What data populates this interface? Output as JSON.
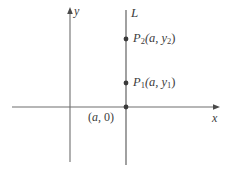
{
  "figure": {
    "type": "coordinate-plane-diagram",
    "background_color": "#ffffff",
    "stroke_color": "#6e6e6e",
    "text_color": "#3c3c3c"
  },
  "axes": {
    "x_axis": {
      "label": "x",
      "y_pixel": 107,
      "x_start": 12,
      "x_end": 220,
      "arrow": "right"
    },
    "y_axis": {
      "label": "y",
      "x_pixel": 70,
      "y_start": 8,
      "y_end": 162,
      "arrow": "up"
    }
  },
  "line": {
    "name": "L",
    "label": "L",
    "equation_form": "x = a",
    "x_pixel": 126,
    "y_start": 10,
    "y_end": 165,
    "orientation": "vertical"
  },
  "points": [
    {
      "id": "p2",
      "label_main": "P",
      "label_sub": "2",
      "label_coords": "(a, y",
      "label_coords_sub": "2",
      "label_coords_end": ")",
      "full_label": "P2(a, y2)",
      "x_pixel": 126,
      "y_pixel": 39
    },
    {
      "id": "p1",
      "label_main": "P",
      "label_sub": "1",
      "label_coords": "(a, y",
      "label_coords_sub": "1",
      "label_coords_end": ")",
      "full_label": "P1(a, y1)",
      "x_pixel": 126,
      "y_pixel": 83
    },
    {
      "id": "intercept",
      "full_label": "(a, 0)",
      "label_open": "(",
      "label_var": "a",
      "label_rest": ", 0)",
      "x_pixel": 126,
      "y_pixel": 107
    }
  ]
}
